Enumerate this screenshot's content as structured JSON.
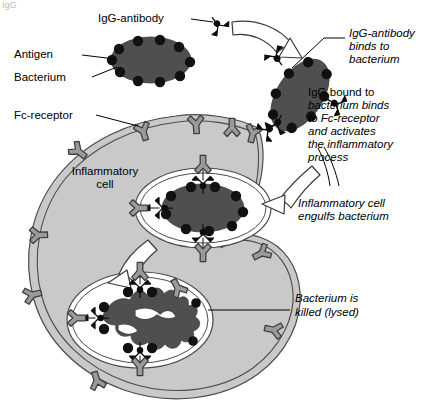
{
  "figure": {
    "caption_fragment": "IgG",
    "title": "",
    "labels": {
      "igg_antibody": "IgG-antibody",
      "antigen": "Antigen",
      "bacterium": "Bacterium",
      "fc_receptor": "Fc-receptor",
      "inflammatory_cell_line1": "Inflammatory",
      "inflammatory_cell_line2": "cell"
    },
    "annotations": {
      "binds": {
        "line1": "IgG-antibody",
        "line2": "binds to",
        "line3": "bacterium"
      },
      "activates": {
        "line1": "IgG bound to",
        "line2": "bacterium binds",
        "line3": "to Fc-receptor",
        "line4": "and activates",
        "line5": "the inflammatory",
        "line6": "process"
      },
      "engulfs": {
        "line1": "Inflammatory cell",
        "line2": "engulfs bacterium"
      },
      "killed": {
        "line1": "Bacterium is",
        "line2": "killed (lysed)"
      }
    },
    "icons": {
      "igg": "y-shaped-antibody-icon",
      "fc_receptor": "y-shaped-receptor-icon",
      "antigen": "dot-icon",
      "process_arrow": "curved-open-arrow-icon"
    },
    "colors": {
      "cytoplasm": "#c9c9c9",
      "bacterium": "#4f4f4f",
      "antigen": "#111111",
      "antibody": "#0d0d0d",
      "fc_receptor": "#9a9a9a",
      "membrane_stroke": "#4a4a4a",
      "vacuole": "#ffffff",
      "background": "#ffffff"
    }
  }
}
